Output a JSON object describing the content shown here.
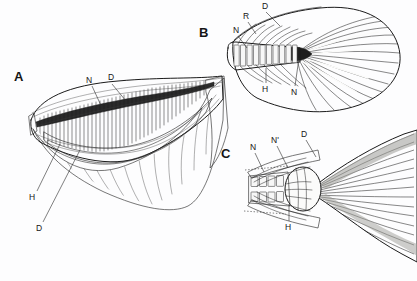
{
  "figure": {
    "type": "anatomical-line-drawing",
    "background_color": "#fdfdfe",
    "ink_color": "#1b1b1b",
    "panel_count": 3
  },
  "panels": [
    {
      "id": "A",
      "letter": "A",
      "description": "lateral view of caudal fin skeleton with overlying dermal sheath",
      "labels": [
        {
          "text": "N",
          "name": "label-n-upper"
        },
        {
          "text": "D",
          "name": "label-d-upper"
        },
        {
          "text": "H",
          "name": "label-h"
        },
        {
          "text": "D",
          "name": "label-d-lower"
        }
      ]
    },
    {
      "id": "B",
      "letter": "B",
      "description": "dorsal view of caudal fin showing vertebral segments and radiating rays",
      "labels": [
        {
          "text": "N",
          "name": "label-n-left"
        },
        {
          "text": "R",
          "name": "label-r"
        },
        {
          "text": "D",
          "name": "label-d"
        },
        {
          "text": "H",
          "name": "label-h"
        },
        {
          "text": "N",
          "name": "label-n-lower"
        }
      ]
    },
    {
      "id": "C",
      "letter": "C",
      "description": "tail fin with hypural plate hub and radiating fin rays",
      "labels": [
        {
          "text": "N",
          "name": "label-n"
        },
        {
          "text": "N'",
          "name": "label-n-prime"
        },
        {
          "text": "D",
          "name": "label-d"
        },
        {
          "text": "H",
          "name": "label-h"
        }
      ]
    }
  ],
  "legend_keys": [
    {
      "key": "N",
      "name": "key-n"
    },
    {
      "key": "N'",
      "name": "key-n-prime"
    },
    {
      "key": "D",
      "name": "key-d"
    },
    {
      "key": "R",
      "name": "key-r"
    },
    {
      "key": "H",
      "name": "key-h"
    }
  ]
}
